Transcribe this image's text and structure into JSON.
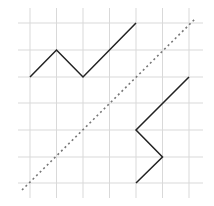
{
  "diagram": {
    "type": "grid-reflection",
    "grid": {
      "color": "#d9d9d9",
      "x_lines": [
        30,
        56.5,
        83,
        109.5,
        136,
        162.5,
        189
      ],
      "y_lines": [
        23,
        50,
        77,
        103,
        130,
        157,
        183
      ],
      "x_extent": [
        18,
        203
      ],
      "y_extent": [
        8,
        198
      ]
    },
    "shapes": [
      {
        "name": "original-polyline",
        "color": "#222222",
        "points": [
          [
            30,
            77
          ],
          [
            56.5,
            50
          ],
          [
            83,
            77
          ],
          [
            136,
            23
          ]
        ]
      },
      {
        "name": "reflected-polyline",
        "color": "#222222",
        "points": [
          [
            189,
            77
          ],
          [
            136,
            130
          ],
          [
            162.5,
            157
          ],
          [
            136,
            183
          ]
        ]
      }
    ],
    "mirror_line": {
      "color": "#777777",
      "style": "dotted",
      "from": [
        22,
        190
      ],
      "to": [
        196,
        18
      ]
    }
  }
}
